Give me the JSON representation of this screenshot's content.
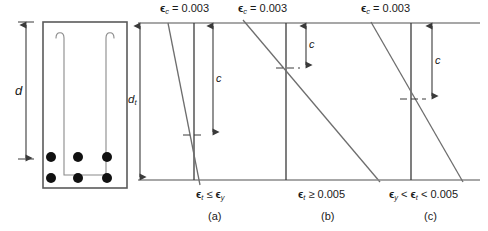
{
  "figure": {
    "type": "engineering-strain-diagram",
    "colors": {
      "line": "#6e6e6e",
      "dark_line": "#3a3a3a",
      "rebar": "#111111",
      "text": "#1a1a1a",
      "background": "#ffffff"
    }
  },
  "cross_section": {
    "depth_label": "d",
    "rebar_count": 6,
    "rebar_rows": 2,
    "rebars_per_row": 3,
    "stirrup": "U-shaped"
  },
  "strain_diagrams": {
    "depth_label_dt": "d",
    "depth_label_dt_sub": "t",
    "neutral_axis_label": "c",
    "panels": [
      {
        "id": "a",
        "caption": "(a)",
        "top_strain_symbol": "ϵ",
        "top_strain_sub": "c",
        "top_strain_text": "= 0.003",
        "bottom_condition_parts": [
          {
            "sym": "ϵ",
            "sub": "t"
          },
          {
            "op": " ≤ "
          },
          {
            "sym": "ϵ",
            "sub": "y"
          }
        ],
        "bottom_condition_plain": "ϵt ≤ ϵy",
        "c_over_dt": 0.72
      },
      {
        "id": "b",
        "caption": "(b)",
        "top_strain_symbol": "ϵ",
        "top_strain_sub": "c",
        "top_strain_text": "= 0.003",
        "bottom_condition_parts": [
          {
            "sym": "ϵ",
            "sub": "t"
          },
          {
            "op": " ≥ 0.005"
          }
        ],
        "bottom_condition_plain": "ϵt ≥ 0.005",
        "c_over_dt": 0.275
      },
      {
        "id": "c",
        "caption": "(c)",
        "top_strain_symbol": "ϵ",
        "top_strain_sub": "c",
        "top_strain_text": "= 0.003",
        "bottom_condition_parts": [
          {
            "sym": "ϵ",
            "sub": "y"
          },
          {
            "op": " < "
          },
          {
            "sym": "ϵ",
            "sub": "t"
          },
          {
            "op": " < 0.005"
          }
        ],
        "bottom_condition_plain": "ϵy < ϵt < 0.005",
        "c_over_dt": 0.48
      }
    ]
  },
  "labels": {
    "epsilon_c_1": "= 0.003",
    "epsilon_c_2": "= 0.003",
    "epsilon_c_3": "= 0.003",
    "caption_a": "(a)",
    "caption_b": "(b)",
    "caption_c": "(c)",
    "c_1": "c",
    "c_2": "c",
    "c_3": "c",
    "d": "d",
    "dt": "d",
    "dt_sub": "t",
    "eps": "ϵ",
    "le": "≤",
    "ge": "≥",
    "lt": "<",
    "val_005": "0.005",
    "sub_c": "c",
    "sub_t": "t",
    "sub_y": "y"
  }
}
